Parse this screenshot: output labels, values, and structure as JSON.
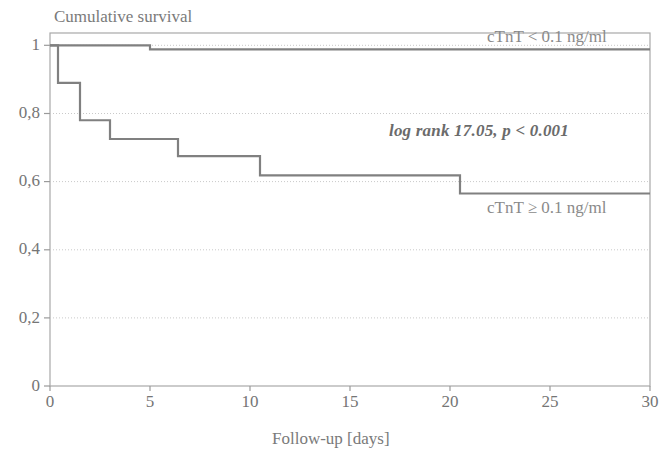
{
  "chart_data": {
    "type": "line",
    "subtype": "kaplan-meier-step",
    "title": "Cumulative survival",
    "xlabel": "Follow-up [days]",
    "ylabel": "Cumulative survival",
    "xlim": [
      0,
      30
    ],
    "ylim": [
      0,
      1
    ],
    "grid": "horizontal-dotted",
    "legend_position": "inline-right",
    "xticks": [
      "0",
      "5",
      "10",
      "15",
      "20",
      "25",
      "30"
    ],
    "xtick_values": [
      0,
      5,
      10,
      15,
      20,
      25,
      30
    ],
    "yticks": [
      "0",
      "0,2",
      "0,4",
      "0,6",
      "0,8",
      "1"
    ],
    "ytick_values": [
      0,
      0.2,
      0.4,
      0.6,
      0.8,
      1.0
    ],
    "series": [
      {
        "name": "cTnT < 0.1 ng/ml",
        "label": "cTnT < 0.1 ng/ml",
        "color": "#808080",
        "steps": [
          {
            "x": 0,
            "y": 1.0
          },
          {
            "x": 5.0,
            "y": 1.0
          },
          {
            "x": 5.0,
            "y": 0.988
          },
          {
            "x": 30,
            "y": 0.988
          }
        ]
      },
      {
        "name": "cTnT >= 0.1 ng/ml",
        "label": "cTnT ≥ 0.1 ng/ml",
        "color": "#808080",
        "steps": [
          {
            "x": 0,
            "y": 1.0
          },
          {
            "x": 0.4,
            "y": 1.0
          },
          {
            "x": 0.4,
            "y": 0.89
          },
          {
            "x": 1.5,
            "y": 0.89
          },
          {
            "x": 1.5,
            "y": 0.78
          },
          {
            "x": 3.0,
            "y": 0.78
          },
          {
            "x": 3.0,
            "y": 0.725
          },
          {
            "x": 6.4,
            "y": 0.725
          },
          {
            "x": 6.4,
            "y": 0.675
          },
          {
            "x": 10.5,
            "y": 0.675
          },
          {
            "x": 10.5,
            "y": 0.618
          },
          {
            "x": 20.5,
            "y": 0.618
          },
          {
            "x": 20.5,
            "y": 0.565
          },
          {
            "x": 30,
            "y": 0.565
          }
        ]
      }
    ],
    "annotations": [
      {
        "name": "log-rank-statistic",
        "text": "log rank 17.05, p < 0.001",
        "x": 16.0,
        "y": 0.775,
        "style": "bold-italic"
      }
    ]
  },
  "axis": {
    "y_ticks": [
      "1",
      "0,8",
      "0,6",
      "0,4",
      "0,2",
      "0"
    ],
    "x_ticks": [
      "0",
      "5",
      "10",
      "15",
      "20",
      "25",
      "30"
    ],
    "x_title": "Follow-up [days]",
    "y_title": "Cumulative survival"
  },
  "labels": {
    "curve_low": "cTnT < 0.1 ng/ml",
    "curve_high": "cTnT ≥ 0.1 ng/ml",
    "log_rank": "log rank 17.05, p < 0.001"
  },
  "colors": {
    "curve": "#808080",
    "axis": "#9a9a9a",
    "grid": "#cccccc",
    "text": "#757575",
    "background": "#ffffff"
  }
}
